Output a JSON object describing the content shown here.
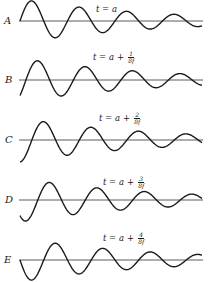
{
  "figure": {
    "title": "",
    "colors": {
      "ink": "#1a1a1a",
      "axis": "#333333",
      "background": "#ffffff"
    },
    "wave": {
      "x_start": 20,
      "x_end": 202,
      "period_px": 47.5,
      "initial_amplitude_px": 22,
      "decay_length_px": 130
    },
    "panels": [
      {
        "letter": "A",
        "axis_y": 21,
        "phase_shift_eighths": 0,
        "time_base": "t = a",
        "time_plus": "",
        "frac_num": "",
        "frac_den": "",
        "label_x": 96,
        "label_y": 5,
        "letter_x": 4
      },
      {
        "letter": "B",
        "axis_y": 80,
        "phase_shift_eighths": 1,
        "time_base": "t = a",
        "time_plus": "+",
        "frac_num": "1",
        "frac_den": "8f",
        "label_x": 93,
        "label_y": 51,
        "letter_x": 5
      },
      {
        "letter": "C",
        "axis_y": 140,
        "phase_shift_eighths": 2,
        "time_base": "t = a",
        "time_plus": "+",
        "frac_num": "2",
        "frac_den": "8f",
        "label_x": 99,
        "label_y": 112,
        "letter_x": 5
      },
      {
        "letter": "D",
        "axis_y": 200,
        "phase_shift_eighths": 3,
        "time_base": "t = a",
        "time_plus": "+",
        "frac_num": "3",
        "frac_den": "8f",
        "label_x": 103,
        "label_y": 176,
        "letter_x": 5
      },
      {
        "letter": "E",
        "axis_y": 260,
        "phase_shift_eighths": 4,
        "time_base": "t = a",
        "time_plus": "+",
        "frac_num": "4",
        "frac_den": "8f",
        "label_x": 103,
        "label_y": 232,
        "letter_x": 4
      }
    ]
  }
}
